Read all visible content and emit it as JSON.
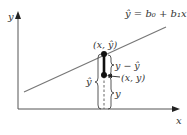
{
  "diagram": {
    "type": "regression-residual-diagram",
    "equation": "ŷ = b₀ + b₁x",
    "axes": {
      "x_label": "x",
      "y_label": "y"
    },
    "points": {
      "predicted_label": "(x, ŷ)",
      "observed_label": "(x, y)"
    },
    "braces": {
      "residual_label": "y − ŷ",
      "y_hat_label": "ŷ",
      "y_label": "y"
    },
    "colors": {
      "axis": "#555555",
      "line": "#666666",
      "point": "#111111",
      "text": "#333333"
    }
  }
}
